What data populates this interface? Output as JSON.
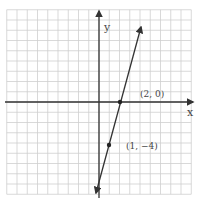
{
  "chart_data": {
    "type": "line",
    "title": "",
    "xlabel": "x",
    "ylabel": "y",
    "xlim": [
      -9,
      9
    ],
    "ylim": [
      -9,
      9
    ],
    "grid": true,
    "series": [
      {
        "name": "line",
        "equation": "y = 4x - 8",
        "x": [
          1,
          2
        ],
        "y": [
          -4,
          0
        ]
      }
    ],
    "points": [
      {
        "x": 2,
        "y": 0,
        "label": "(2, 0)"
      },
      {
        "x": 1,
        "y": -4,
        "label": "(1, -4)"
      }
    ]
  },
  "labels": {
    "x_axis": "x",
    "y_axis": "y",
    "point_a": "(2, 0)",
    "point_b": "(1, −4)"
  },
  "colors": {
    "grid": "#cfcfcf",
    "axis": "#333333",
    "line": "#333333"
  }
}
